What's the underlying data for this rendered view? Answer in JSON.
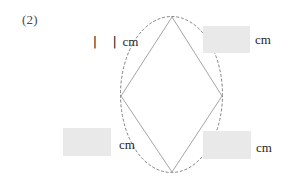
{
  "problem": {
    "number_label": "(2)",
    "known_measure": {
      "value": "| |",
      "unit": "cm",
      "reading": "11 cm"
    }
  },
  "figure": {
    "shape_name": "rhombus",
    "outline_color": "#9a9a9a",
    "guide_color": "#6e6e6e",
    "guide_style": "dashed-ellipse",
    "vertices": {
      "top": {
        "x": 172,
        "y": 17
      },
      "right": {
        "x": 222,
        "y": 96
      },
      "bottom": {
        "x": 172,
        "y": 172
      },
      "left": {
        "x": 121,
        "y": 96
      }
    }
  },
  "answers": [
    {
      "id": "top-right",
      "value": "",
      "placeholder": "",
      "unit": "cm",
      "fill_color": "#e9e9e9"
    },
    {
      "id": "bottom-left",
      "value": "",
      "placeholder": "",
      "unit": "cm",
      "fill_color": "#e9e9e9"
    },
    {
      "id": "bottom-right",
      "value": "",
      "placeholder": "",
      "unit": "cm",
      "fill_color": "#e9e9e9"
    }
  ]
}
